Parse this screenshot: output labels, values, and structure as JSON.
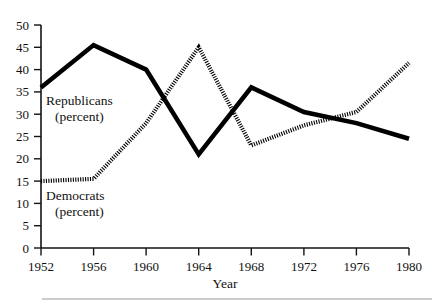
{
  "chart_data": {
    "type": "line",
    "title": "",
    "subtitle": "",
    "xlabel": "Year",
    "ylabel": "",
    "categories": [
      1952,
      1956,
      1960,
      1964,
      1968,
      1972,
      1976,
      1980
    ],
    "x": [
      1952,
      1956,
      1960,
      1964,
      1968,
      1972,
      1976,
      1980
    ],
    "xlim": [
      1952,
      1980
    ],
    "ylim": [
      0,
      50
    ],
    "ytick_values": [
      0,
      5,
      10,
      15,
      20,
      25,
      30,
      35,
      40,
      45,
      50
    ],
    "ytick_labels": [
      "0",
      "5",
      "10",
      "15",
      "20",
      "25",
      "30",
      "35",
      "40",
      "45",
      "50"
    ],
    "xtick_labels": [
      "1952",
      "1956",
      "1960",
      "1964",
      "1968",
      "1972",
      "1976",
      "1980"
    ],
    "grid": false,
    "legend_position": "inline-annotations",
    "series": [
      {
        "name": "Republicans (percent)",
        "style": "solid-thick",
        "color": "#000000",
        "label_line1": "Republicans",
        "label_line2": "(percent)",
        "values": [
          36,
          45.5,
          40,
          21,
          36,
          30.5,
          28,
          24.5
        ]
      },
      {
        "name": "Democrats (percent)",
        "style": "dotted-thick",
        "color": "#000000",
        "label_line1": "Democrats",
        "label_line2": "(percent)",
        "values": [
          15,
          15.5,
          28,
          45,
          23,
          27.5,
          30.5,
          41.5
        ]
      }
    ]
  },
  "annotations": {
    "republicans_line1": "Republicans",
    "republicans_line2": "(percent)",
    "democrats_line1": "Democrats",
    "democrats_line2": "(percent)",
    "x_axis_title": "Year"
  },
  "y_ticks": {
    "t50": "50",
    "t45": "45",
    "t40": "40",
    "t35": "35",
    "t30": "30",
    "t25": "25",
    "t20": "20",
    "t15": "15",
    "t10": "10",
    "t5": "5",
    "t0": "0"
  },
  "x_ticks": {
    "x1952": "1952",
    "x1956": "1956",
    "x1960": "1960",
    "x1964": "1964",
    "x1968": "1968",
    "x1972": "1972",
    "x1976": "1976",
    "x1980": "1980"
  },
  "colors": {
    "ink": "#000000",
    "axis": "#141414",
    "rule": "#9a9a9a",
    "background": "#ffffff"
  }
}
